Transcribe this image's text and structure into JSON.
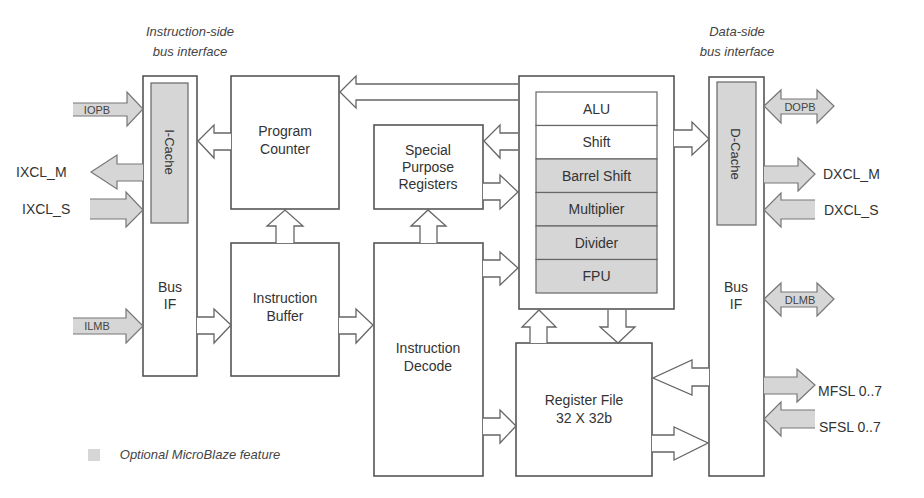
{
  "diagram": {
    "headers": {
      "instruction_side_line1": "Instruction-side",
      "instruction_side_line2": "bus interface",
      "data_side_line1": "Data-side",
      "data_side_line2": "bus interface"
    },
    "blocks": {
      "i_cache": "I-Cache",
      "i_bus_if_line1": "Bus",
      "i_bus_if_line2": "IF",
      "program_counter_line1": "Program",
      "program_counter_line2": "Counter",
      "instruction_buffer_line1": "Instruction",
      "instruction_buffer_line2": "Buffer",
      "spr_line1": "Special",
      "spr_line2": "Purpose",
      "spr_line3": "Registers",
      "instruction_decode_line1": "Instruction",
      "instruction_decode_line2": "Decode",
      "register_file_line1": "Register File",
      "register_file_line2": "32 X 32b",
      "d_cache": "D-Cache",
      "d_bus_if_line1": "Bus",
      "d_bus_if_line2": "IF"
    },
    "execution_units": [
      {
        "label": "ALU",
        "optional": false
      },
      {
        "label": "Shift",
        "optional": false
      },
      {
        "label": "Barrel Shift",
        "optional": true
      },
      {
        "label": "Multiplier",
        "optional": true
      },
      {
        "label": "Divider",
        "optional": true
      },
      {
        "label": "FPU",
        "optional": true
      }
    ],
    "signals": {
      "iopb": "IOPB",
      "ixcl_m": "IXCL_M",
      "ixcl_s": "IXCL_S",
      "ilmb": "ILMB",
      "dopb": "DOPB",
      "dxcl_m": "DXCL_M",
      "dxcl_s": "DXCL_S",
      "dlmb": "DLMB",
      "mfsl": "MFSL 0..7",
      "sfsl": "SFSL 0..7"
    },
    "legend": {
      "label": "Optional MicroBlaze feature",
      "color": "#d6d6d6"
    }
  }
}
